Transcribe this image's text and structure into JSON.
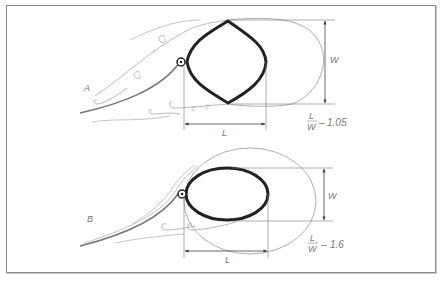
{
  "figure": {
    "panels": [
      {
        "id": "A",
        "label": "A",
        "length_label": "L",
        "width_label": "W",
        "ratio": {
          "numerator": "L",
          "denominator": "W",
          "value": "1.05"
        }
      },
      {
        "id": "B",
        "label": "B",
        "length_label": "L",
        "width_label": "W",
        "ratio": {
          "numerator": "L",
          "denominator": "W",
          "value": "1.6"
        }
      }
    ],
    "colors": {
      "bubble_outline": "#222222",
      "flow_lines": "#888888",
      "dimension_lines": "#555555",
      "frame": "#8a8a8a"
    }
  }
}
